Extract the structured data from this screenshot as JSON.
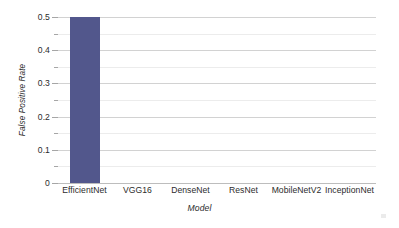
{
  "chart_data": {
    "type": "bar",
    "title": "",
    "subtitle": "",
    "xlabel": "Model",
    "ylabel": "False Positive Rate",
    "categories": [
      "EfficientNet",
      "VGG16",
      "DenseNet",
      "ResNet",
      "MobileNetV2",
      "InceptionNet"
    ],
    "values": [
      0.5,
      0,
      0,
      0,
      0,
      0
    ],
    "series": [
      {
        "name": "False Positive Rate",
        "values": [
          0.5,
          0,
          0,
          0,
          0,
          0
        ]
      }
    ],
    "ylim": [
      0,
      0.5
    ],
    "ytick_labels": [
      "0",
      "0.1",
      "0.2",
      "0.3",
      "0.4",
      "0.5"
    ],
    "ytick_values": [
      0,
      0.1,
      0.2,
      0.3,
      0.4,
      0.5
    ],
    "yminor_tick_values": [
      0.05,
      0.15,
      0.25,
      0.35,
      0.45
    ],
    "grid": "horizontal",
    "legend": "none",
    "annotations": [],
    "bar_color": "#52578C",
    "major_gridline_color": "#d2d2d2",
    "minor_gridline_color": "#ececec",
    "axis_color": "#bdbdbd",
    "text_color": "#2b2b2b",
    "background_color": "#ffffff"
  }
}
